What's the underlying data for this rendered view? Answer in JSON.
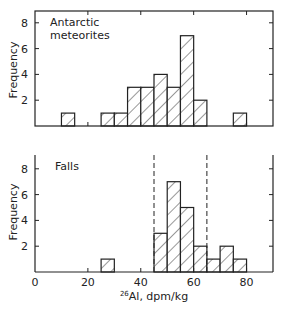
{
  "chart_data": [
    {
      "type": "bar",
      "title": "Antarctic meteorites",
      "xlabel": "",
      "ylabel": "Frequency",
      "xlim": [
        0,
        90
      ],
      "ylim": [
        0,
        9
      ],
      "bin_width": 5,
      "bins": [
        {
          "x0": 10,
          "x1": 15,
          "count": 1
        },
        {
          "x0": 25,
          "x1": 30,
          "count": 1
        },
        {
          "x0": 30,
          "x1": 35,
          "count": 1
        },
        {
          "x0": 35,
          "x1": 40,
          "count": 3
        },
        {
          "x0": 40,
          "x1": 45,
          "count": 3
        },
        {
          "x0": 45,
          "x1": 50,
          "count": 4
        },
        {
          "x0": 50,
          "x1": 55,
          "count": 3
        },
        {
          "x0": 55,
          "x1": 60,
          "count": 7
        },
        {
          "x0": 60,
          "x1": 65,
          "count": 2
        },
        {
          "x0": 75,
          "x1": 80,
          "count": 1
        }
      ],
      "yticks": [
        2,
        4,
        6,
        8
      ],
      "xticks": [
        20,
        40,
        60,
        80
      ],
      "hatched": true
    },
    {
      "type": "bar",
      "title": "Falls",
      "xlabel": "26Al, dpm/kg",
      "ylabel": "Frequency",
      "xlim": [
        0,
        90
      ],
      "ylim": [
        0,
        9
      ],
      "bin_width": 5,
      "bins": [
        {
          "x0": 25,
          "x1": 30,
          "count": 1
        },
        {
          "x0": 45,
          "x1": 50,
          "count": 3
        },
        {
          "x0": 50,
          "x1": 55,
          "count": 7
        },
        {
          "x0": 55,
          "x1": 60,
          "count": 5
        },
        {
          "x0": 60,
          "x1": 65,
          "count": 2
        },
        {
          "x0": 65,
          "x1": 70,
          "count": 1
        },
        {
          "x0": 70,
          "x1": 75,
          "count": 2
        },
        {
          "x0": 75,
          "x1": 80,
          "count": 1
        }
      ],
      "yticks": [
        2,
        4,
        6,
        8
      ],
      "xticks": [
        0,
        20,
        40,
        60,
        80
      ],
      "reference_lines": [
        45,
        65
      ],
      "hatched": true
    }
  ],
  "labels": {
    "top_annotation_line1": "Antarctic",
    "top_annotation_line2": "meteorites",
    "bottom_annotation": "Falls",
    "ylabel": "Frequency",
    "xlabel_sup": "26",
    "xlabel_rest": "Al, dpm/kg",
    "ytick_labels": [
      "2",
      "4",
      "6",
      "8"
    ],
    "xtick_labels": [
      "0",
      "20",
      "40",
      "60",
      "80"
    ]
  }
}
